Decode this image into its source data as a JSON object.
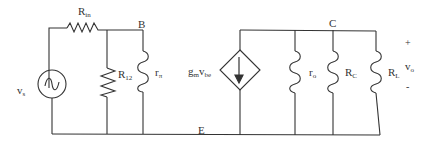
{
  "diagram": {
    "type": "small-signal equivalent circuit (BJT hybrid-pi model)",
    "nodes": {
      "base": "B",
      "collector": "C",
      "emitter": "E"
    },
    "source": {
      "label_main": "v",
      "label_sub": "s",
      "icon": "ac-voltage-source-icon"
    },
    "components": {
      "rin": {
        "main": "R",
        "sub": "in"
      },
      "r12": {
        "main": "R",
        "sub": "12"
      },
      "rpi": {
        "main": "r",
        "sub": "π"
      },
      "gm": {
        "main": "g",
        "sub1": "m",
        "mid": "v",
        "sub2": "be"
      },
      "ro": {
        "main": "r",
        "sub": "o"
      },
      "rc": {
        "main": "R",
        "sub": "C"
      },
      "rl": {
        "main": "R",
        "sub": "L"
      }
    },
    "output": {
      "plus": "+",
      "label_main": "v",
      "label_sub": "o",
      "minus": "-"
    },
    "colors": {
      "wire": "#333333",
      "background": "#ffffff"
    }
  }
}
